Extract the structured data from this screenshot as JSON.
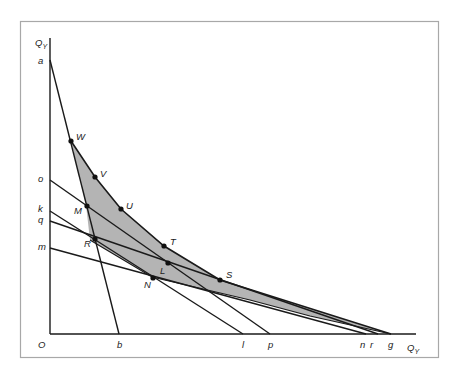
{
  "diagram": {
    "axes": {
      "y_label": "Q",
      "y_sub": "Y",
      "x_label": "Q",
      "x_sub": "Y",
      "origin": "O"
    },
    "colors": {
      "shade": "#b4b4b4",
      "line": "#1a1a1a",
      "frame": "#a8a8a8"
    },
    "y_intercepts": [
      "a",
      "o",
      "k",
      "q",
      "m"
    ],
    "x_intercepts": [
      "b",
      "l",
      "p",
      "n",
      "r",
      "g"
    ],
    "points": [
      "W",
      "V",
      "U",
      "M",
      "T",
      "R",
      "L",
      "S",
      "N"
    ],
    "labels": {
      "a": "a",
      "o": "o",
      "k": "k",
      "q": "q",
      "m": "m",
      "b": "b",
      "l": "l",
      "p": "p",
      "n": "n",
      "r": "r",
      "g": "g",
      "W": "W",
      "V": "V",
      "U": "U",
      "M": "M",
      "T": "T",
      "R": "R",
      "L": "L",
      "S": "S",
      "N": "N"
    },
    "lines": [
      {
        "from": "a",
        "to": "b"
      },
      {
        "from": "o",
        "to": "p"
      },
      {
        "from": "k",
        "to": "l"
      },
      {
        "from": "q",
        "to": "r"
      },
      {
        "from": "m",
        "to": "n"
      }
    ],
    "shaded_region": "W-V-U-T-S-g-N-R-W"
  }
}
